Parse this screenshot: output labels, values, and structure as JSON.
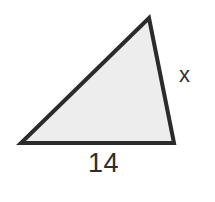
{
  "figure": {
    "kind": "triangle-diagram",
    "background_color": "#ffffff",
    "canvas": {
      "width": 215,
      "height": 202
    },
    "shape": {
      "name": "scalene-triangle",
      "fill_color": "#ededed",
      "stroke_color": "#2b2b2b",
      "stroke_width": 4,
      "vertices": [
        {
          "name": "apex",
          "x": 149,
          "y": 18
        },
        {
          "name": "bottom-right",
          "x": 174,
          "y": 143
        },
        {
          "name": "bottom-left",
          "x": 21,
          "y": 143
        }
      ],
      "points_attr": "149,18 174,143 21,143"
    },
    "labels": {
      "base": {
        "text": "14",
        "side": "bottom",
        "color": "#2e2e2e"
      },
      "right": {
        "text": "x",
        "side": "right",
        "color": "#2e2e2e"
      }
    }
  }
}
